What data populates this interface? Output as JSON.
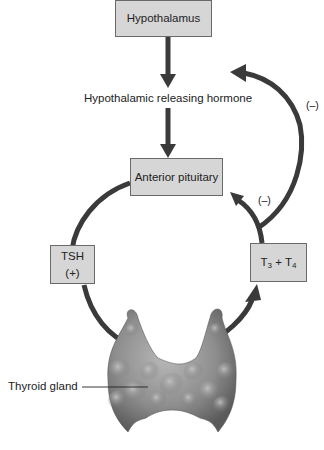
{
  "diagram": {
    "nodes": {
      "hypothalamus": "Hypothalamus",
      "releasing_hormone": "Hypothalamic releasing hormone",
      "anterior_pituitary": "Anterior pituitary",
      "tsh": "TSH",
      "tsh_sign": "(+)",
      "t_base": "T",
      "t3_sub": "3",
      "plus": " + ",
      "t4_sub": "4",
      "thyroid_label": "Thyroid gland"
    },
    "feedback": {
      "outer_sign": "(–)",
      "inner_sign": "(–)"
    },
    "colors": {
      "box_fill": "#d6d6d6",
      "box_border": "#6a6a6a",
      "arrow": "#3a3a3a",
      "gland": "#8a8a8a"
    }
  }
}
